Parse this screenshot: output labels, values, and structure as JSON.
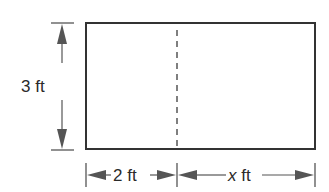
{
  "diagram": {
    "type": "rectangle-with-dimensions",
    "colors": {
      "stroke": "#333333",
      "dimension": "#555555",
      "background": "#ffffff"
    },
    "height_label": "3 ft",
    "left_width_label_num": "2",
    "left_width_label_unit": "ft",
    "right_width_label_var": "x",
    "right_width_label_unit": "ft",
    "divider": "dashed"
  }
}
